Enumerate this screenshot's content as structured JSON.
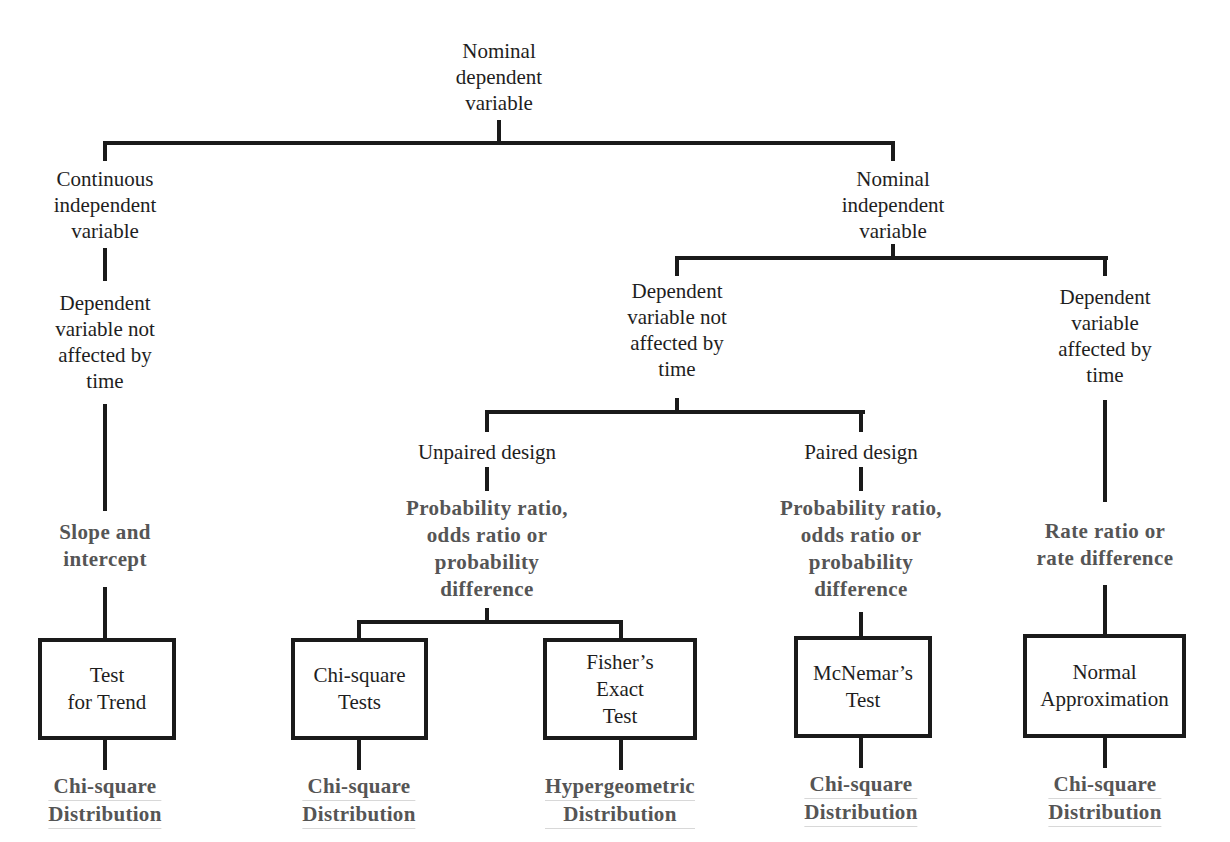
{
  "root": {
    "lines": [
      "Nominal",
      "dependent",
      "variable"
    ]
  },
  "continuous_branch": {
    "label": [
      "Continuous",
      "independent",
      "variable"
    ],
    "condition": [
      "Dependent",
      "variable not",
      "affected by",
      "time"
    ],
    "measure": [
      "Slope and",
      "intercept"
    ],
    "test": [
      "Test",
      "for Trend"
    ],
    "distribution": [
      "Chi-square",
      "Distribution"
    ]
  },
  "nominal_branch": {
    "label": [
      "Nominal",
      "independent",
      "variable"
    ],
    "not_time": {
      "condition": [
        "Dependent",
        "variable not",
        "affected by",
        "time"
      ],
      "unpaired": {
        "label": "Unpaired design",
        "measure": [
          "Probability ratio,",
          "odds ratio or",
          "probability",
          "difference"
        ],
        "tests": [
          {
            "name": [
              "Chi-square",
              "Tests"
            ],
            "distribution": [
              "Chi-square",
              "Distribution"
            ]
          },
          {
            "name": [
              "Fisher’s",
              "Exact",
              "Test"
            ],
            "distribution": [
              "Hypergeometric",
              "Distribution"
            ]
          }
        ]
      },
      "paired": {
        "label": "Paired design",
        "measure": [
          "Probability ratio,",
          "odds ratio or",
          "probability",
          "difference"
        ],
        "test": [
          "McNemar’s",
          "Test"
        ],
        "distribution": [
          "Chi-square",
          "Distribution"
        ]
      }
    },
    "time": {
      "condition": [
        "Dependent",
        "variable",
        "affected by",
        "time"
      ],
      "measure": [
        "Rate ratio or",
        "rate difference"
      ],
      "test": [
        "Normal",
        "Approximation"
      ],
      "distribution": [
        "Chi-square",
        "Distribution"
      ]
    }
  },
  "colors": {
    "line": "#1a1a1a",
    "text": "#1e1e1e",
    "bold_text": "#555555",
    "background": "#ffffff"
  }
}
